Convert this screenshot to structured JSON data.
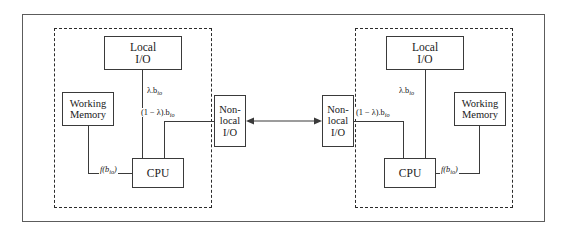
{
  "figure": {
    "colors": {
      "outer_frame": "#5c5c5c",
      "dashed_border": "#2b2b2b",
      "box_border": "#3a3a3a",
      "line": "#3a3a3a",
      "text": "#1a1a1a",
      "background": "#ffffff"
    }
  },
  "nodes": {
    "left": {
      "name": "left-node",
      "boxes": {
        "local_io": {
          "line1": "Local",
          "line2": "I/O"
        },
        "working_memory": {
          "line1": "Working",
          "line2": "Memory"
        },
        "cpu": {
          "line1": "CPU"
        },
        "nonlocal_io": {
          "line1": "Non-",
          "line2": "local",
          "line3": "I/O"
        }
      },
      "labels": {
        "lambda_bio": "λ.b",
        "lambda_bio_sub": "io",
        "one_minus_lambda_bio": "(1 − λ).b",
        "one_minus_lambda_bio_sub": "io",
        "f_bio_prefix": "f(b",
        "f_bio_sub": "io",
        "f_bio_suffix": ")"
      }
    },
    "right": {
      "name": "right-node",
      "boxes": {
        "local_io": {
          "line1": "Local",
          "line2": "I/O"
        },
        "working_memory": {
          "line1": "Working",
          "line2": "Memory"
        },
        "cpu": {
          "line1": "CPU"
        },
        "nonlocal_io": {
          "line1": "Non-",
          "line2": "local",
          "line3": "I/O"
        }
      },
      "labels": {
        "lambda_bio": "λ.b",
        "lambda_bio_sub": "io",
        "one_minus_lambda_bio": "(1 − λ).b",
        "one_minus_lambda_bio_sub": "io",
        "f_bio_prefix": "f(b",
        "f_bio_sub": "io",
        "f_bio_suffix": ")"
      }
    }
  },
  "interconnect": {
    "name": "nonlocal-interconnect",
    "type": "bidirectional"
  }
}
